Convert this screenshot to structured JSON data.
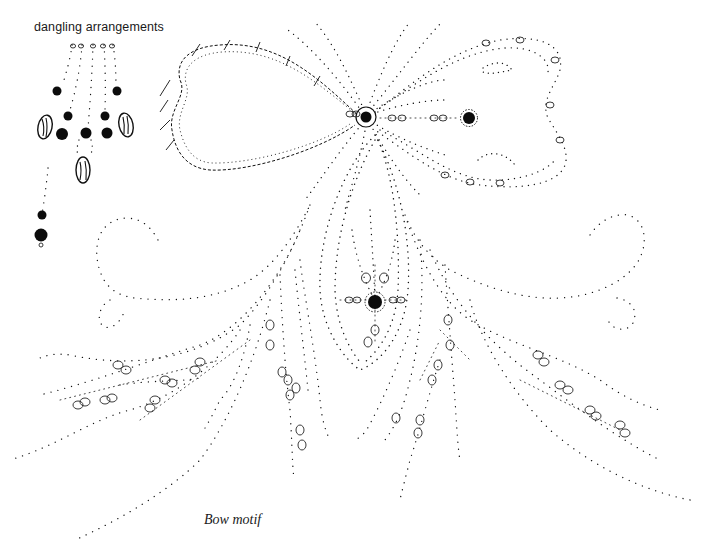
{
  "labels": {
    "dangling": "dangling arrangements",
    "caption": "Bow motif"
  },
  "figure": {
    "elements": [
      "dangling bead arrangements",
      "bow with two loops",
      "center jewel",
      "teardrop pendant",
      "left scroll",
      "right scroll",
      "left fronds",
      "right fronds"
    ]
  },
  "colors": {
    "ink": "#111111",
    "background": "#ffffff"
  }
}
